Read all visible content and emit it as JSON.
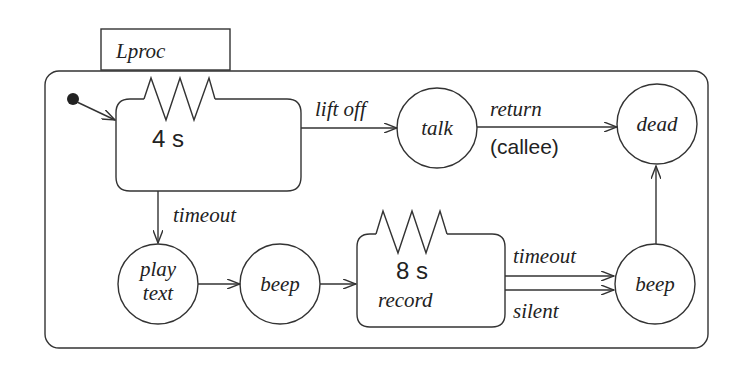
{
  "diagram": {
    "type": "statechart",
    "container": {
      "label": "Lproc"
    },
    "states": [
      {
        "id": "wait",
        "shape": "timer-box",
        "timer": "4 s",
        "label": ""
      },
      {
        "id": "talk",
        "shape": "circle",
        "label": "talk"
      },
      {
        "id": "dead",
        "shape": "circle",
        "label": "dead"
      },
      {
        "id": "play_text",
        "shape": "circle",
        "label_line1": "play",
        "label_line2": "text"
      },
      {
        "id": "beep1",
        "shape": "circle",
        "label": "beep"
      },
      {
        "id": "record",
        "shape": "timer-box",
        "timer": "8 s",
        "label": "record"
      },
      {
        "id": "beep2",
        "shape": "circle",
        "label": "beep"
      }
    ],
    "transitions": [
      {
        "from": "initial",
        "to": "wait",
        "label": ""
      },
      {
        "from": "wait",
        "to": "talk",
        "label": "lift off"
      },
      {
        "from": "talk",
        "to": "dead",
        "label": "return",
        "sublabel": "(callee)"
      },
      {
        "from": "wait",
        "to": "play_text",
        "label": "timeout"
      },
      {
        "from": "play_text",
        "to": "beep1",
        "label": ""
      },
      {
        "from": "beep1",
        "to": "record",
        "label": ""
      },
      {
        "from": "record",
        "to": "beep2",
        "label": "timeout"
      },
      {
        "from": "record",
        "to": "beep2",
        "label": "silent"
      },
      {
        "from": "beep2",
        "to": "dead",
        "label": ""
      }
    ]
  }
}
